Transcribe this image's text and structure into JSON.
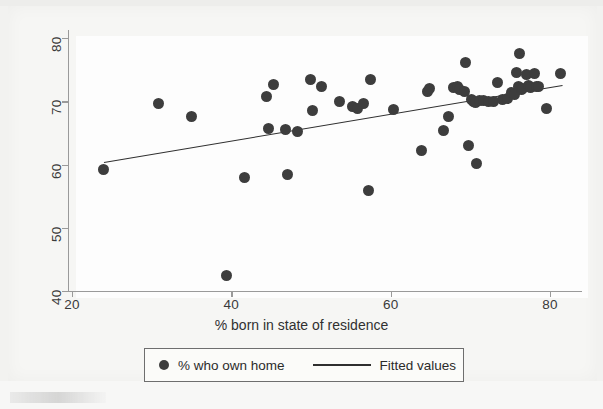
{
  "chart_data": {
    "type": "scatter",
    "title": "",
    "xlabel": "% born in state of residence",
    "ylabel": "",
    "xlim": [
      20,
      82
    ],
    "ylim": [
      38,
      81
    ],
    "xticks": [
      20,
      40,
      60,
      80
    ],
    "yticks": [
      40,
      50,
      60,
      70,
      80
    ],
    "xtick_labels": [
      "20",
      "40",
      "60",
      "80"
    ],
    "ytick_labels": [
      "40",
      "50",
      "60",
      "70",
      "80"
    ],
    "grid": false,
    "legend_position": "below-axis",
    "legend": [
      {
        "label": "% who own home",
        "marker": "filled-circle",
        "color": "#3d3d3d"
      },
      {
        "label": "Fitted values",
        "marker": "line",
        "color": "#2f2f2f"
      }
    ],
    "series": [
      {
        "name": "% who own home",
        "marker": "filled-circle",
        "color": "#3d3d3d",
        "points": [
          [
            24.0,
            59.2
          ],
          [
            30.8,
            69.6
          ],
          [
            35.0,
            67.6
          ],
          [
            39.4,
            42.5
          ],
          [
            41.6,
            57.9
          ],
          [
            44.4,
            70.8
          ],
          [
            44.6,
            65.7
          ],
          [
            45.3,
            72.7
          ],
          [
            46.8,
            65.6
          ],
          [
            47.1,
            58.5
          ],
          [
            48.3,
            65.2
          ],
          [
            49.9,
            73.5
          ],
          [
            50.2,
            68.6
          ],
          [
            51.3,
            72.4
          ],
          [
            53.6,
            69.9
          ],
          [
            55.2,
            69.2
          ],
          [
            55.8,
            68.8
          ],
          [
            56.6,
            69.7
          ],
          [
            57.2,
            55.9
          ],
          [
            57.4,
            73.4
          ],
          [
            60.3,
            68.7
          ],
          [
            63.9,
            62.3
          ],
          [
            64.6,
            71.5
          ],
          [
            64.9,
            72.0
          ],
          [
            66.6,
            65.4
          ],
          [
            67.2,
            67.6
          ],
          [
            67.9,
            72.2
          ],
          [
            68.4,
            72.4
          ],
          [
            68.6,
            71.9
          ],
          [
            69.2,
            71.6
          ],
          [
            69.4,
            76.1
          ],
          [
            69.8,
            63.0
          ],
          [
            70.1,
            70.3
          ],
          [
            70.4,
            70.0
          ],
          [
            70.6,
            69.8
          ],
          [
            70.8,
            60.2
          ],
          [
            71.2,
            70.2
          ],
          [
            71.6,
            70.1
          ],
          [
            72.3,
            70.0
          ],
          [
            72.9,
            69.9
          ],
          [
            73.4,
            73.0
          ],
          [
            74.0,
            70.3
          ],
          [
            74.6,
            70.5
          ],
          [
            75.1,
            71.4
          ],
          [
            75.5,
            71.0
          ],
          [
            75.8,
            74.5
          ],
          [
            76.0,
            72.3
          ],
          [
            76.2,
            77.5
          ],
          [
            76.4,
            71.8
          ],
          [
            76.6,
            72.0
          ],
          [
            77.0,
            74.2
          ],
          [
            77.3,
            72.5
          ],
          [
            77.6,
            72.2
          ],
          [
            78.0,
            74.4
          ],
          [
            78.3,
            72.4
          ],
          [
            78.6,
            72.3
          ],
          [
            79.6,
            68.9
          ],
          [
            81.3,
            74.4
          ]
        ]
      },
      {
        "name": "Fitted values",
        "marker": "line",
        "color": "#2f2f2f",
        "line": {
          "x0": 24.0,
          "y0": 60.4,
          "x1": 81.6,
          "y1": 72.6
        }
      }
    ]
  },
  "axis": {
    "x_title": "% born in state of residence"
  },
  "legend": {
    "points_label": "% who own home",
    "line_label": "Fitted values"
  }
}
